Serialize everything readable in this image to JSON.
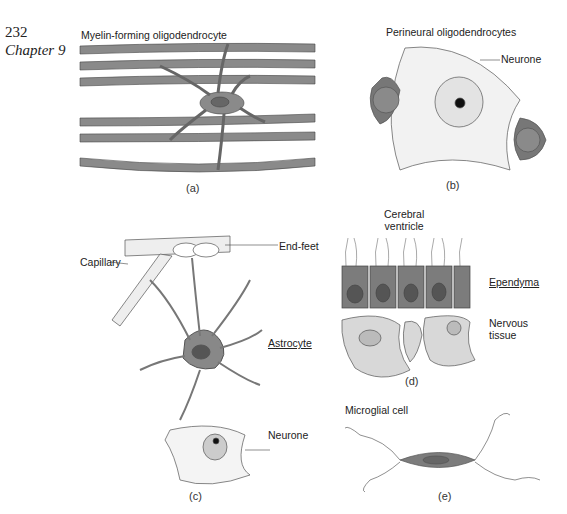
{
  "page": {
    "number": "232",
    "chapter": "Chapter 9"
  },
  "figures": {
    "a": {
      "title": "Myelin-forming oligodendrocyte",
      "caption": "(a)"
    },
    "b": {
      "title": "Perineural oligodendrocytes",
      "labels": {
        "neurone": "Neurone"
      },
      "caption": "(b)"
    },
    "c": {
      "labels": {
        "end_feet": "End-feet",
        "capillary": "Capillary",
        "astrocyte": "Astrocyte",
        "neurone": "Neurone"
      },
      "caption": "(c)"
    },
    "d": {
      "title": "Cerebral ventricle",
      "title_line1": "Cerebral",
      "title_line2": "ventricle",
      "labels": {
        "ependyma": "Ependyma",
        "nervous_tissue_1": "Nervous",
        "nervous_tissue_2": "tissue"
      },
      "caption": "(d)"
    },
    "e": {
      "title": "Microglial cell",
      "caption": "(e)"
    }
  },
  "colors": {
    "cell_fill": "#7a7a7a",
    "nucleus": "#555555",
    "stipple": "#d6d6d6",
    "line": "#333333"
  }
}
